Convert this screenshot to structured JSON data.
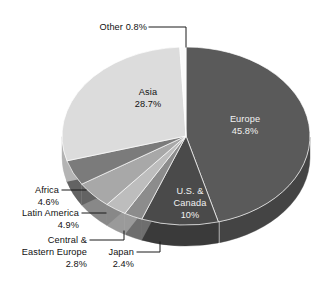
{
  "chart_data": {
    "type": "pie",
    "title": "",
    "subtitle": "",
    "xlabel": "",
    "ylabel": "",
    "legend": "none",
    "grid": false,
    "units": "percent",
    "start_angle_deg": 0,
    "direction": "clockwise",
    "three_d": true,
    "categories": [
      "Europe",
      "U.S. & Canada",
      "Japan",
      "Central & Eastern Europe",
      "Latin America",
      "Africa",
      "Asia",
      "Other"
    ],
    "values": [
      45.8,
      10.0,
      2.4,
      2.8,
      4.9,
      4.6,
      28.7,
      0.8
    ],
    "slices": [
      {
        "name": "Europe",
        "value": 45.8,
        "label_line1": "Europe",
        "label_line2": "45.8%",
        "label_placement": "inside",
        "label_color": "#f2f2f2",
        "color": "#5a5a5a",
        "side_color": "#444444"
      },
      {
        "name": "U.S. & Canada",
        "value": 10.0,
        "label_line1": "U.S. &",
        "label_line2": "Canada",
        "label_line3": "10%",
        "label_placement": "inside",
        "label_color": "#eeeeee",
        "color": "#4a4a4a",
        "side_color": "#3a3a3a"
      },
      {
        "name": "Japan",
        "value": 2.4,
        "label_line1": "Japan",
        "label_line2": "2.4%",
        "label_placement": "callout",
        "label_color": "#111111",
        "color": "#8c8c8c",
        "side_color": "#6e6e6e"
      },
      {
        "name": "Central & Eastern Europe",
        "value": 2.8,
        "label_line1": "Central &",
        "label_line2": "Eastern Europe",
        "label_line3": "2.8%",
        "label_placement": "callout",
        "label_color": "#111111",
        "color": "#bdbdbd",
        "side_color": "#9a9a9a"
      },
      {
        "name": "Latin America",
        "value": 4.9,
        "label_line1": "Latin America",
        "label_line2": "4.9%",
        "label_placement": "callout",
        "label_color": "#111111",
        "color": "#a8a8a8",
        "side_color": "#888888"
      },
      {
        "name": "Africa",
        "value": 4.6,
        "label_line1": "Africa",
        "label_line2": "4.6%",
        "label_placement": "callout",
        "label_color": "#111111",
        "color": "#7b7b7b",
        "side_color": "#636363"
      },
      {
        "name": "Asia",
        "value": 28.7,
        "label_line1": "Asia",
        "label_line2": "28.7%",
        "label_placement": "inside",
        "label_color": "#111111",
        "color": "#dcdcdc",
        "side_color": "#b4b4b4"
      },
      {
        "name": "Other",
        "value": 0.8,
        "label_line1": "Other 0.8%",
        "label_placement": "callout",
        "label_color": "#111111",
        "color": "#fbfbfb",
        "side_color": "#d0d0d0"
      }
    ],
    "colors": {
      "background": "#ffffff",
      "leader_line": "#1a1a1a",
      "text_dark": "#111111",
      "text_light": "#f2f2f2"
    }
  },
  "labels": {
    "other": {
      "line1": "Other 0.8%"
    },
    "asia": {
      "line1": "Asia",
      "line2": "28.7%"
    },
    "europe": {
      "line1": "Europe",
      "line2": "45.8%"
    },
    "us_canada": {
      "line1": "U.S. &",
      "line2": "Canada",
      "line3": "10%"
    },
    "africa": {
      "line1": "Africa",
      "line2": "4.6%"
    },
    "latin_america": {
      "line1": "Latin America",
      "line2": "4.9%"
    },
    "central_eastern_europe": {
      "line1": "Central &",
      "line2": "Eastern Europe",
      "line3": "2.8%"
    },
    "japan": {
      "line1": "Japan",
      "line2": "2.4%"
    }
  }
}
